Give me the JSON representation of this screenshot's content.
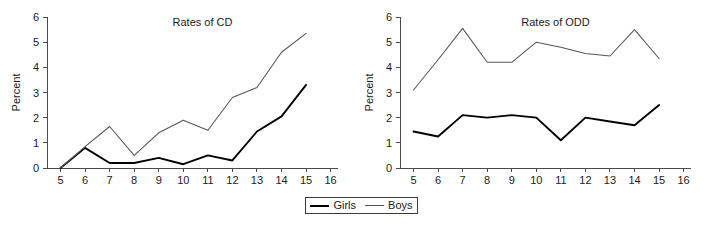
{
  "figure": {
    "legend": {
      "entries": [
        {
          "label": "Girls",
          "color": "#000000"
        },
        {
          "label": "Boys",
          "color": "#555555"
        }
      ]
    }
  },
  "chart_data": [
    {
      "type": "line",
      "title": "Rates of CD",
      "xlabel": "Age",
      "ylabel": "Percent",
      "x": [
        5,
        6,
        7,
        8,
        9,
        10,
        11,
        12,
        13,
        14,
        15
      ],
      "xticks": [
        5,
        6,
        7,
        8,
        9,
        10,
        11,
        12,
        13,
        14,
        15,
        16
      ],
      "yticks": [
        0,
        1,
        2,
        3,
        4,
        5,
        6
      ],
      "xlim": [
        4.45,
        16.3
      ],
      "ylim": [
        0,
        6
      ],
      "grid": false,
      "legend_position": "below-figure-center",
      "series": [
        {
          "name": "Girls",
          "color": "#000000",
          "values": [
            0.0,
            0.8,
            0.2,
            0.2,
            0.4,
            0.15,
            0.5,
            0.3,
            1.45,
            2.05,
            3.3
          ]
        },
        {
          "name": "Boys",
          "color": "#555555",
          "values": [
            0.0,
            0.85,
            1.65,
            0.5,
            1.4,
            1.9,
            1.5,
            2.8,
            3.2,
            4.6,
            5.35
          ]
        }
      ]
    },
    {
      "type": "line",
      "title": "Rates of ODD",
      "xlabel": "Age",
      "ylabel": "Percent",
      "x": [
        5,
        6,
        7,
        8,
        9,
        10,
        11,
        12,
        13,
        14,
        15
      ],
      "xticks": [
        5,
        6,
        7,
        8,
        9,
        10,
        11,
        12,
        13,
        14,
        15,
        16
      ],
      "yticks": [
        0,
        1,
        2,
        3,
        4,
        5,
        6
      ],
      "xlim": [
        4.45,
        16.3
      ],
      "ylim": [
        0,
        6
      ],
      "grid": false,
      "legend_position": "below-figure-center",
      "series": [
        {
          "name": "Girls",
          "color": "#000000",
          "values": [
            1.45,
            1.25,
            2.1,
            2.0,
            2.1,
            2.0,
            1.1,
            2.0,
            1.85,
            1.7,
            2.5
          ]
        },
        {
          "name": "Boys",
          "color": "#555555",
          "values": [
            3.1,
            4.3,
            5.55,
            4.2,
            4.2,
            5.0,
            4.8,
            4.55,
            4.45,
            5.5,
            4.35
          ]
        }
      ]
    }
  ]
}
